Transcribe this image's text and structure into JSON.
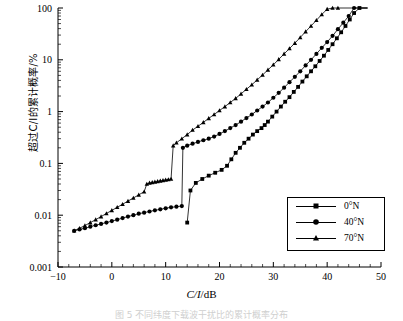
{
  "axes": {
    "ylabel": "超过C/I的累计概率/%",
    "xlabel_num": "C/I",
    "xlabel_unit": "/dB",
    "xticks": [
      "-10",
      "0",
      "10",
      "20",
      "30",
      "40",
      "50"
    ],
    "yticks": [
      "100",
      "10",
      "1",
      "0.1",
      "0.01",
      "0.001"
    ]
  },
  "legend": {
    "items": [
      {
        "label": "0°N",
        "marker": "square-marker"
      },
      {
        "label": "40°N",
        "marker": "circle-marker"
      },
      {
        "label": "70°N",
        "marker": "triangle-marker"
      }
    ]
  },
  "caption": "图 5   不同纬度下载波干扰比的累计概率分布",
  "chart_data": {
    "type": "line",
    "title": "",
    "xlabel": "C/I/dB",
    "ylabel": "超过C/I的累计概率/%",
    "xlim": [
      -10,
      50
    ],
    "ylim": [
      0.001,
      100
    ],
    "yscale": "log",
    "grid": false,
    "legend_position": "lower-right",
    "series": [
      {
        "name": "0°N",
        "marker": "square",
        "x": [
          14.0,
          14.6,
          15.6,
          16.8,
          18.0,
          19.2,
          20.4,
          21.4,
          22.2,
          23.0,
          23.8,
          24.6,
          25.4,
          26.2,
          27.0,
          27.8,
          28.4,
          29.0,
          29.8,
          30.6,
          31.4,
          32.2,
          33.0,
          33.8,
          34.6,
          35.4,
          36.2,
          37.0,
          37.8,
          38.6,
          39.4,
          40.2,
          41.0,
          41.8,
          42.6,
          43.4,
          44.2,
          45.0,
          46.0,
          47.5
        ],
        "y": [
          0.0072,
          0.03,
          0.042,
          0.05,
          0.058,
          0.066,
          0.075,
          0.09,
          0.12,
          0.16,
          0.2,
          0.25,
          0.3,
          0.36,
          0.42,
          0.48,
          0.55,
          0.64,
          0.8,
          1.0,
          1.25,
          1.55,
          1.9,
          2.4,
          3.0,
          3.8,
          4.8,
          6.0,
          7.5,
          9.5,
          12.0,
          15.5,
          20.0,
          26.0,
          34.0,
          45.0,
          60.0,
          80.0,
          100.0,
          100.0
        ]
      },
      {
        "name": "40°N",
        "marker": "circle",
        "x": [
          -7.0,
          -6.0,
          -5.0,
          -4.0,
          -3.0,
          -2.0,
          -1.0,
          0.0,
          1.0,
          2.0,
          3.0,
          4.0,
          5.0,
          6.0,
          7.0,
          8.0,
          9.0,
          10.0,
          11.0,
          12.0,
          13.0,
          13.2,
          14.0,
          15.0,
          16.0,
          17.0,
          18.0,
          19.0,
          20.0,
          21.0,
          22.0,
          23.0,
          24.0,
          25.0,
          26.0,
          27.0,
          28.0,
          29.0,
          30.0,
          31.0,
          32.0,
          33.0,
          34.0,
          35.0,
          36.0,
          37.0,
          38.0,
          39.0,
          40.0,
          41.0,
          42.0,
          43.0,
          44.0,
          45.0,
          47.5
        ],
        "y": [
          0.005,
          0.0053,
          0.0056,
          0.006,
          0.0064,
          0.0068,
          0.0072,
          0.0077,
          0.0082,
          0.0088,
          0.0094,
          0.01,
          0.0107,
          0.0112,
          0.0118,
          0.0124,
          0.013,
          0.0136,
          0.0142,
          0.0146,
          0.015,
          0.2,
          0.22,
          0.24,
          0.26,
          0.28,
          0.3,
          0.33,
          0.37,
          0.42,
          0.48,
          0.55,
          0.64,
          0.75,
          0.88,
          1.05,
          1.25,
          1.5,
          1.85,
          2.3,
          2.9,
          3.7,
          4.7,
          6.0,
          7.8,
          10.0,
          13.0,
          17.0,
          22.0,
          29.0,
          39.0,
          52.0,
          70.0,
          100.0,
          100.0
        ]
      },
      {
        "name": "70°N",
        "marker": "triangle",
        "x": [
          -7.0,
          -6.0,
          -5.0,
          -4.0,
          -3.0,
          -2.0,
          -1.0,
          0.0,
          1.0,
          2.0,
          3.0,
          4.0,
          5.0,
          6.0,
          6.5,
          7.0,
          7.5,
          8.0,
          8.5,
          9.0,
          9.5,
          10.0,
          10.5,
          11.0,
          11.4,
          12.0,
          13.0,
          14.0,
          15.0,
          16.0,
          17.0,
          18.0,
          19.0,
          20.0,
          21.0,
          22.0,
          23.0,
          24.0,
          25.0,
          26.0,
          27.0,
          28.0,
          29.0,
          30.0,
          31.0,
          32.0,
          33.0,
          34.0,
          35.0,
          36.0,
          37.0,
          38.0,
          39.0,
          40.0,
          41.0,
          42.0,
          47.5
        ],
        "y": [
          0.005,
          0.0056,
          0.0063,
          0.0072,
          0.0082,
          0.0094,
          0.0108,
          0.0124,
          0.0142,
          0.0163,
          0.0187,
          0.0215,
          0.0247,
          0.0284,
          0.04,
          0.042,
          0.043,
          0.044,
          0.045,
          0.046,
          0.047,
          0.048,
          0.049,
          0.05,
          0.22,
          0.25,
          0.3,
          0.36,
          0.44,
          0.52,
          0.62,
          0.74,
          0.88,
          1.05,
          1.25,
          1.5,
          1.8,
          2.2,
          2.7,
          3.3,
          4.1,
          5.1,
          6.4,
          8.0,
          10.2,
          13.0,
          16.5,
          21.0,
          27.0,
          35.0,
          45.0,
          58.0,
          75.0,
          95.0,
          100.0,
          100.0,
          100.0
        ]
      }
    ]
  }
}
